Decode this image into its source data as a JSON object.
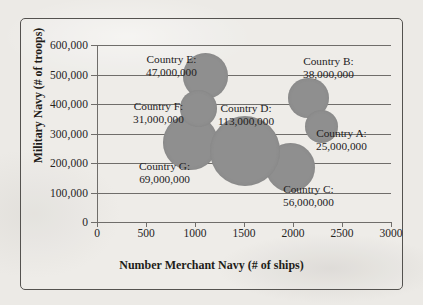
{
  "chart_data": {
    "type": "scatter",
    "title": "",
    "subtitle": "",
    "xlabel": "Number Merchant Navy (# of ships)",
    "ylabel": "Military Navy (# of troops)",
    "xlim": [
      0,
      3000
    ],
    "ylim": [
      0,
      600000
    ],
    "xticks": [
      "0",
      "500",
      "1000",
      "1500",
      "2000",
      "2500",
      "3000"
    ],
    "yticks": [
      "0",
      "100,000",
      "200,000",
      "300,000",
      "400,000",
      "500,000",
      "600,000"
    ],
    "grid": "horizontal",
    "legend": "none",
    "bubble_color": "#8f8f8f",
    "points": [
      {
        "name": "Country A",
        "label_line1": "Country A:",
        "label_line2": "25,000,000",
        "x": 2290,
        "y": 325000,
        "size": 25000000
      },
      {
        "name": "Country B",
        "label_line1": "Country B:",
        "label_line2": "38,000,000",
        "x": 2160,
        "y": 420000,
        "size": 38000000
      },
      {
        "name": "Country C",
        "label_line1": "Country C:",
        "label_line2": "56,000,000",
        "x": 1975,
        "y": 185000,
        "size": 56000000
      },
      {
        "name": "Country D",
        "label_line1": "Country D:",
        "label_line2": "113,000,000",
        "x": 1515,
        "y": 240000,
        "size": 113000000
      },
      {
        "name": "Country E",
        "label_line1": "Country E:",
        "label_line2": "47,000,000",
        "x": 1105,
        "y": 495000,
        "size": 47000000
      },
      {
        "name": "Country F",
        "label_line1": "Country F:",
        "label_line2": "31,000,000",
        "x": 1035,
        "y": 385000,
        "size": 31000000
      },
      {
        "name": "Country G",
        "label_line1": "Country G:",
        "label_line2": "69,000,000",
        "x": 955,
        "y": 270000,
        "size": 69000000
      }
    ]
  },
  "axes": {
    "y": {
      "title": "Military Navy (# of troops)",
      "ticks": [
        {
          "value": "600,000"
        },
        {
          "value": "500,000"
        },
        {
          "value": "400,000"
        },
        {
          "value": "300,000"
        },
        {
          "value": "200,000"
        },
        {
          "value": "100,000"
        },
        {
          "value": "0"
        }
      ]
    },
    "x": {
      "title": "Number Merchant Navy (# of ships)",
      "ticks": [
        {
          "value": "0"
        },
        {
          "value": "500"
        },
        {
          "value": "1000"
        },
        {
          "value": "1500"
        },
        {
          "value": "2000"
        },
        {
          "value": "2500"
        },
        {
          "value": "3000"
        }
      ]
    }
  }
}
